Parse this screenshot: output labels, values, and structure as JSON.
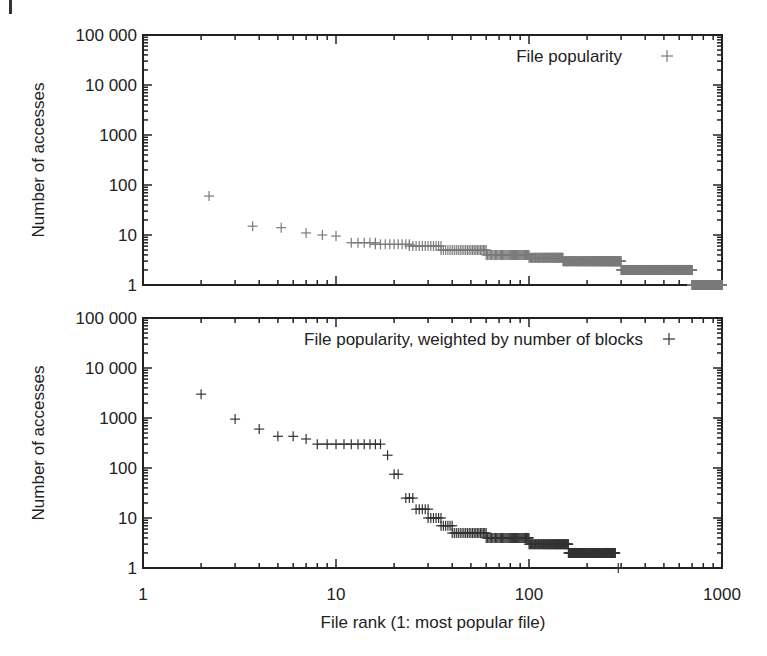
{
  "figure": {
    "xlabel": "File rank (1: most popular file)",
    "x_ticks": [
      "1",
      "10",
      "100",
      "1000"
    ],
    "y_ticks": [
      "1",
      "10",
      "100",
      "1000",
      "10 000",
      "100 000"
    ]
  },
  "chart_data": [
    {
      "type": "scatter",
      "title": "",
      "legend": "File popularity",
      "legend_position": "top-right",
      "xlabel": "",
      "ylabel": "Number of accesses",
      "xscale": "log",
      "yscale": "log",
      "xlim": [
        1,
        1000
      ],
      "ylim": [
        1,
        100000
      ],
      "grid": false,
      "marker": "+",
      "marker_color": "#7a7a7a",
      "series": [
        {
          "name": "File popularity",
          "points": [
            [
              2.2,
              60
            ],
            [
              3.7,
              15
            ],
            [
              5.2,
              14
            ],
            [
              7,
              11
            ],
            [
              8.5,
              10
            ],
            [
              10,
              9.5
            ],
            [
              [
                12,
                16
              ],
              7
            ],
            [
              [
                16,
                24
              ],
              6.5
            ],
            [
              [
                24,
                35
              ],
              6
            ],
            [
              [
                35,
                60
              ],
              5
            ],
            [
              [
                60,
                100
              ],
              4
            ],
            [
              [
                100,
                150
              ],
              3.5
            ],
            [
              [
                150,
                300
              ],
              3
            ],
            [
              [
                300,
                700
              ],
              2
            ],
            [
              [
                700,
                1000
              ],
              1
            ]
          ]
        }
      ]
    },
    {
      "type": "scatter",
      "title": "",
      "legend": "File popularity, weighted by number of blocks",
      "legend_position": "top-right",
      "xlabel": "File rank (1: most popular file)",
      "ylabel": "Number of accesses",
      "xscale": "log",
      "yscale": "log",
      "xlim": [
        1,
        1000
      ],
      "ylim": [
        1,
        100000
      ],
      "grid": false,
      "marker": "+",
      "marker_color": "#333333",
      "series": [
        {
          "name": "File popularity, weighted by number of blocks",
          "points": [
            [
              2,
              3000
            ],
            [
              3,
              950
            ],
            [
              4,
              600
            ],
            [
              5,
              430
            ],
            [
              6,
              430
            ],
            [
              7,
              380
            ],
            [
              [
                8,
                17
              ],
              300
            ],
            [
              18.5,
              180
            ],
            [
              [
                20,
                21
              ],
              75
            ],
            [
              [
                23,
                25
              ],
              25
            ],
            [
              [
                26,
                30
              ],
              15
            ],
            [
              [
                30,
                35
              ],
              10
            ],
            [
              [
                35,
                40
              ],
              7
            ],
            [
              [
                40,
                60
              ],
              5
            ],
            [
              [
                60,
                100
              ],
              4
            ],
            [
              [
                100,
                160
              ],
              3
            ],
            [
              [
                160,
                280
              ],
              2
            ],
            [
              290,
              1
            ]
          ]
        }
      ]
    }
  ],
  "plots": {
    "top": {
      "ylabel": "Number of accesses",
      "legend": "File popularity"
    },
    "bottom": {
      "ylabel": "Number of accesses",
      "legend": "File popularity, weighted by number of blocks"
    }
  }
}
